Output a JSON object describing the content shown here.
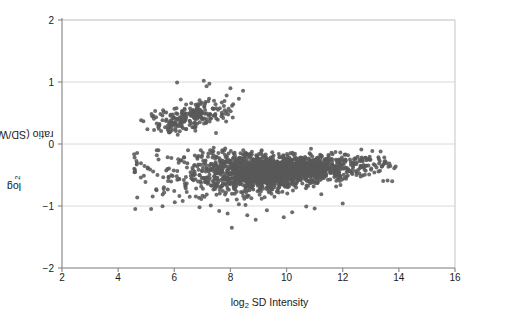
{
  "chart_data": {
    "type": "scatter",
    "title": "",
    "xlabel": "log2 SD Intensity",
    "xlabel_base": "log",
    "xlabel_sub": "2",
    "xlabel_rest": " SD Intensity",
    "ylabel": "log2 ratio (SD/Wistar)",
    "ylabel_base": "log",
    "ylabel_sub": "2",
    "ylabel_rest": " ratio (SD/Wistar)",
    "xlim": [
      2,
      16
    ],
    "ylim": [
      -2,
      2
    ],
    "xticks": [
      2,
      4,
      6,
      8,
      10,
      12,
      14,
      16
    ],
    "xticklabels": [
      "2",
      "4",
      "6",
      "8",
      "10",
      "12",
      "14",
      "16"
    ],
    "yticks": [
      2,
      1,
      0,
      -1,
      -2
    ],
    "yticklabels": [
      "2",
      "1",
      "0",
      "-1",
      "-2"
    ],
    "grid": "horizontal",
    "grid_color": "#d8d8d8",
    "axis_color": "#8c8c8c",
    "point_color": "#595959",
    "point_size": 2.0,
    "legend": "none",
    "n_points_approx": 2100,
    "clusters": [
      {
        "name": "upper-band",
        "description": "sparser elevated band of probes with positive log2 ratio",
        "n": 230,
        "x_range": [
          4.8,
          8.6
        ],
        "y_center": 0.42,
        "y_range": [
          0.15,
          1.05
        ],
        "x_mode": 6.6
      },
      {
        "name": "main-band",
        "description": "dense bulk of probes with negative log2 ratio, tapering upward at high intensity",
        "n": 1870,
        "x_range": [
          4.4,
          13.9
        ],
        "y_center": -0.42,
        "y_range": [
          -1.4,
          -0.05
        ],
        "x_mode": 9.6
      }
    ],
    "annotations": []
  }
}
